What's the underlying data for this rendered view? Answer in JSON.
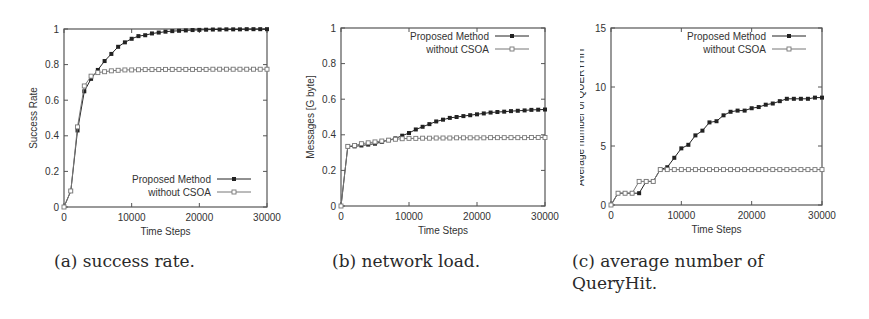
{
  "figure": {
    "legend": {
      "proposed": "Proposed Method",
      "without": "without CSOA"
    },
    "colors": {
      "proposed": "#222222",
      "without": "#777777",
      "axis": "#555555"
    }
  },
  "captions": {
    "a": "(a) success rate.",
    "b": "(b) network load.",
    "c_line1": "(c) average number of",
    "c_line2": "QueryHit."
  },
  "chart_data": [
    {
      "id": "a",
      "type": "line",
      "title": "",
      "caption": "(a) success rate.",
      "xlabel": "Time Steps",
      "ylabel": "Success Rate",
      "xlim": [
        0,
        30000
      ],
      "ylim": [
        0,
        1
      ],
      "xticks": [
        "0",
        "10000",
        "20000",
        "30000"
      ],
      "yticks": [
        "0",
        "0.2",
        "0.4",
        "0.6",
        "0.8",
        "1"
      ],
      "grid": false,
      "legend_position": "lower right",
      "x": [
        0,
        1000,
        2000,
        3000,
        4000,
        5000,
        6000,
        7000,
        8000,
        9000,
        10000,
        11000,
        12000,
        13000,
        14000,
        15000,
        16000,
        17000,
        18000,
        19000,
        20000,
        21000,
        22000,
        23000,
        24000,
        25000,
        26000,
        27000,
        28000,
        29000,
        30000
      ],
      "series": [
        {
          "name": "Proposed Method",
          "marker": "filled-square",
          "values": [
            0,
            0.09,
            0.43,
            0.65,
            0.72,
            0.77,
            0.82,
            0.86,
            0.9,
            0.925,
            0.945,
            0.96,
            0.965,
            0.975,
            0.98,
            0.985,
            0.988,
            0.99,
            0.992,
            0.994,
            0.995,
            0.996,
            0.997,
            0.997,
            0.998,
            0.998,
            0.998,
            0.999,
            0.999,
            0.999,
            0.999
          ]
        },
        {
          "name": "without CSOA",
          "marker": "open-square",
          "values": [
            0,
            0.09,
            0.45,
            0.68,
            0.735,
            0.755,
            0.76,
            0.765,
            0.768,
            0.77,
            0.77,
            0.771,
            0.772,
            0.772,
            0.772,
            0.773,
            0.773,
            0.773,
            0.773,
            0.773,
            0.773,
            0.773,
            0.774,
            0.774,
            0.774,
            0.774,
            0.774,
            0.774,
            0.774,
            0.774,
            0.774
          ]
        }
      ]
    },
    {
      "id": "b",
      "type": "line",
      "title": "",
      "caption": "(b) network load.",
      "xlabel": "Time Steps",
      "ylabel": "Messages [G byte]",
      "xlim": [
        0,
        30000
      ],
      "ylim": [
        0,
        1
      ],
      "xticks": [
        "0",
        "10000",
        "20000",
        "30000"
      ],
      "yticks": [
        "0",
        "0.2",
        "0.4",
        "0.6",
        "0.8",
        "1"
      ],
      "grid": false,
      "legend_position": "upper right",
      "x": [
        0,
        1000,
        2000,
        3000,
        4000,
        5000,
        6000,
        7000,
        8000,
        9000,
        10000,
        11000,
        12000,
        13000,
        14000,
        15000,
        16000,
        17000,
        18000,
        19000,
        20000,
        21000,
        22000,
        23000,
        24000,
        25000,
        26000,
        27000,
        28000,
        29000,
        30000
      ],
      "series": [
        {
          "name": "Proposed Method",
          "marker": "filled-square",
          "values": [
            0,
            0.335,
            0.335,
            0.34,
            0.345,
            0.35,
            0.36,
            0.37,
            0.38,
            0.395,
            0.41,
            0.43,
            0.445,
            0.46,
            0.475,
            0.485,
            0.495,
            0.5,
            0.505,
            0.51,
            0.515,
            0.52,
            0.525,
            0.528,
            0.53,
            0.533,
            0.535,
            0.537,
            0.54,
            0.541,
            0.542
          ]
        },
        {
          "name": "without CSOA",
          "marker": "open-square",
          "values": [
            0,
            0.335,
            0.34,
            0.35,
            0.355,
            0.36,
            0.365,
            0.37,
            0.375,
            0.378,
            0.38,
            0.38,
            0.381,
            0.381,
            0.382,
            0.382,
            0.382,
            0.383,
            0.383,
            0.383,
            0.383,
            0.383,
            0.384,
            0.384,
            0.384,
            0.384,
            0.384,
            0.384,
            0.385,
            0.385,
            0.385
          ]
        }
      ]
    },
    {
      "id": "c",
      "type": "line",
      "title": "",
      "caption": "(c) average number of QueryHit.",
      "xlabel": "Time Steps",
      "ylabel": "Average number of QUERYHIT",
      "xlim": [
        0,
        30000
      ],
      "ylim": [
        0,
        15
      ],
      "xticks": [
        "0",
        "10000",
        "20000",
        "30000"
      ],
      "yticks": [
        "0",
        "5",
        "10",
        "15"
      ],
      "grid": false,
      "legend_position": "upper right",
      "x": [
        0,
        1000,
        2000,
        3000,
        4000,
        5000,
        6000,
        7000,
        8000,
        9000,
        10000,
        11000,
        12000,
        13000,
        14000,
        15000,
        16000,
        17000,
        18000,
        19000,
        20000,
        21000,
        22000,
        23000,
        24000,
        25000,
        26000,
        27000,
        28000,
        29000,
        30000
      ],
      "series": [
        {
          "name": "Proposed Method",
          "marker": "filled-square",
          "values": [
            0,
            1,
            1,
            1,
            1,
            2,
            2,
            3,
            3.2,
            4,
            4.8,
            5.1,
            5.9,
            6.3,
            7,
            7.1,
            7.6,
            7.9,
            8,
            8,
            8.2,
            8.3,
            8.5,
            8.6,
            8.8,
            9,
            9,
            9,
            9,
            9.1,
            9.1
          ]
        },
        {
          "name": "without CSOA",
          "marker": "open-square",
          "values": [
            0,
            1,
            1,
            1,
            2,
            2,
            2,
            3,
            3,
            3,
            3,
            3,
            3,
            3,
            3,
            3,
            3,
            3,
            3,
            3,
            3,
            3,
            3,
            3,
            3,
            3,
            3,
            3,
            3,
            3,
            3
          ]
        }
      ]
    }
  ]
}
